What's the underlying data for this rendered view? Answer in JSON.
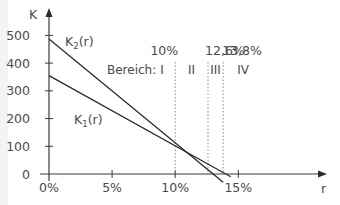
{
  "chart_data": {
    "type": "line",
    "title": "",
    "xlabel": "r",
    "ylabel": "K",
    "xlim": [
      0,
      17
    ],
    "ylim": [
      0,
      530
    ],
    "x_ticks": [
      "0%",
      "5%",
      "10%",
      "15%"
    ],
    "y_ticks": [
      "0",
      "100",
      "200",
      "300",
      "400",
      "500"
    ],
    "grid": false,
    "series": [
      {
        "name": "K2(r)",
        "label_main": "K",
        "label_sub": "2",
        "label_tail": "(r)",
        "x": [
          0,
          13.8
        ],
        "y": [
          487,
          -30
        ]
      },
      {
        "name": "K1(r)",
        "label_main": "K",
        "label_sub": "1",
        "label_tail": "(r)",
        "x": [
          0,
          14.4
        ],
        "y": [
          355,
          -10
        ]
      }
    ],
    "intersection": {
      "r": 10,
      "K": 88
    },
    "region_boundaries": [
      {
        "r": 10,
        "label": "10%"
      },
      {
        "r": 12.6,
        "label": "12,6%"
      },
      {
        "r": 13.8,
        "label": "13,8%"
      }
    ],
    "regions_label": "Bereich:",
    "regions": [
      "I",
      "II",
      "III",
      "IV"
    ]
  },
  "colors": {
    "line": "#2b2b2b",
    "axis": "#3a3a3a",
    "text": "#4a4a4a",
    "dotted": "#8a8a8a"
  }
}
